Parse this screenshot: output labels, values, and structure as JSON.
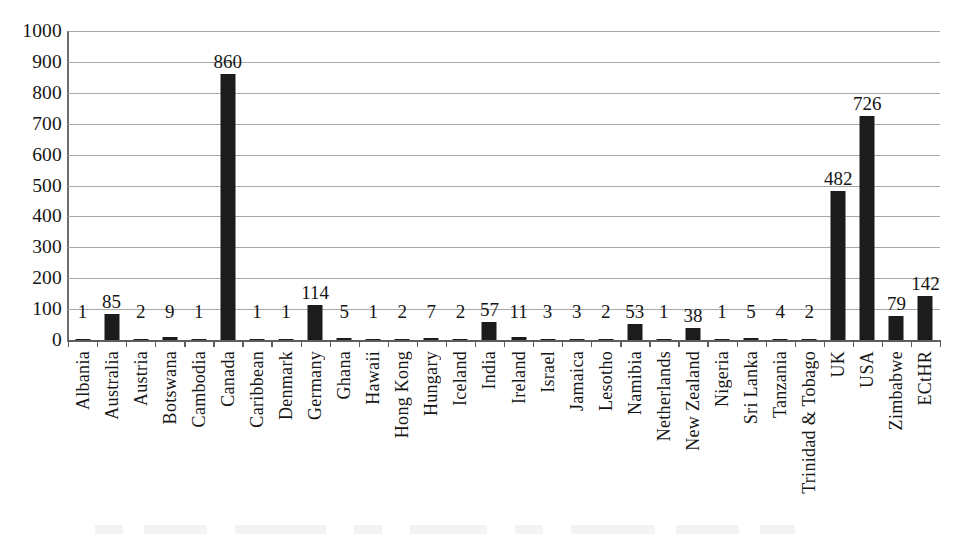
{
  "chart_data": {
    "type": "bar",
    "title": "",
    "xlabel": "",
    "ylabel": "",
    "ylim": [
      0,
      1000
    ],
    "y_ticks": [
      0,
      100,
      200,
      300,
      400,
      500,
      600,
      700,
      800,
      900,
      1000
    ],
    "y_tick_labels": [
      "0",
      "100",
      "200",
      "300",
      "400",
      "500",
      "600",
      "700",
      "800",
      "900",
      "1000"
    ],
    "grid": true,
    "legend": "none",
    "bar_color": "#1c1c1c",
    "grid_color": "#a8a8a8",
    "axis_color": "#5e5e5e",
    "data_labels": true,
    "categories": [
      "Albania",
      "Australia",
      "Austria",
      "Botswana",
      "Cambodia",
      "Canada",
      "Caribbean",
      "Denmark",
      "Germany",
      "Ghana",
      "Hawaii",
      "Hong Kong",
      "Hungary",
      "Iceland",
      "India",
      "Ireland",
      "Israel",
      "Jamaica",
      "Lesotho",
      "Namibia",
      "Netherlands",
      "New Zealand",
      "Nigeria",
      "Sri Lanka",
      "Tanzania",
      "Trinidad & Tobago",
      "UK",
      "USA",
      "Zimbabwe",
      "ECtHR"
    ],
    "values": [
      1,
      85,
      2,
      9,
      1,
      860,
      1,
      1,
      114,
      5,
      1,
      2,
      7,
      2,
      57,
      11,
      3,
      3,
      2,
      53,
      1,
      38,
      1,
      5,
      4,
      2,
      482,
      726,
      79,
      142
    ],
    "value_labels": [
      "1",
      "85",
      "2",
      "9",
      "1",
      "860",
      "1",
      "1",
      "114",
      "5",
      "1",
      "2",
      "7",
      "2",
      "57",
      "11",
      "3",
      "3",
      "2",
      "53",
      "1",
      "38",
      "1",
      "5",
      "4",
      "2",
      "482",
      "726",
      "79",
      "142"
    ]
  }
}
